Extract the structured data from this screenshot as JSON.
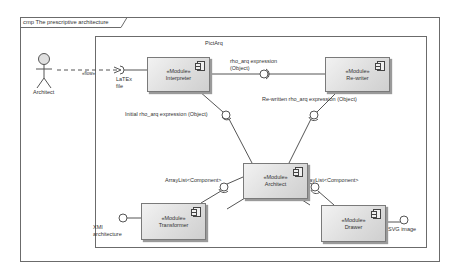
{
  "frame": {
    "title": "cmp The prescriptive architecture"
  },
  "package": {
    "name": "PictArq"
  },
  "actor": {
    "name": "Architect"
  },
  "dependency": {
    "stereotype": "«flow»"
  },
  "components": [
    {
      "id": "interpreter",
      "stereotype": "«Module»",
      "name": "Interpreter"
    },
    {
      "id": "rewriter",
      "stereotype": "«Module»",
      "name": "Re-writer"
    },
    {
      "id": "architect",
      "stereotype": "«Module»",
      "name": "Architect"
    },
    {
      "id": "transformer",
      "stereotype": "«Module»",
      "name": "Transformer"
    },
    {
      "id": "drawer",
      "stereotype": "«Module»",
      "name": "Drawer"
    }
  ],
  "interfaces": {
    "latex_file": "LaTEx\nfile",
    "rho_expr": "rho_arq expression\n(Object)",
    "initial_rho": "Initial rho_arq expression (Object)",
    "rewritten_rho": "Re-written rho_arq expression (Object)",
    "arraylist_left": "ArrayList<Component>",
    "arraylist_right": "ArrayList<Component>",
    "xmi": "XMI\narchitecture",
    "svg": "SVG image"
  },
  "colors": {
    "line": "#555555",
    "frame": "#6b6b6b",
    "component_fill": "#dcdcdc"
  }
}
